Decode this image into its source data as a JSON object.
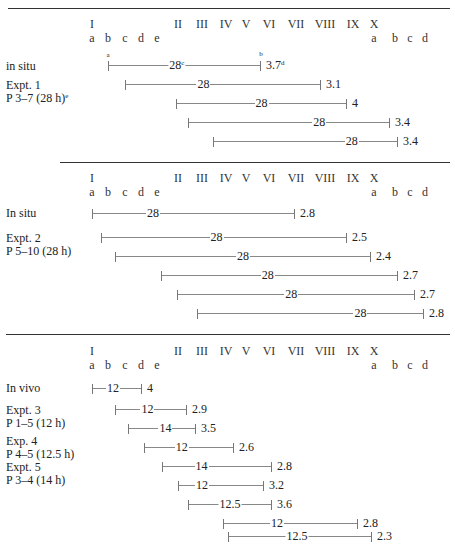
{
  "header_columns": {
    "roman": [
      {
        "label": "I",
        "x": 92
      },
      {
        "label": "II",
        "x": 178
      },
      {
        "label": "III",
        "x": 202
      },
      {
        "label": "IV",
        "x": 226
      },
      {
        "label": "V",
        "x": 246
      },
      {
        "label": "VI",
        "x": 269
      },
      {
        "label": "VII",
        "x": 296
      },
      {
        "label": "VIII",
        "x": 325
      },
      {
        "label": "IX",
        "x": 353
      },
      {
        "label": "X",
        "x": 374
      }
    ],
    "letters": [
      {
        "label": "a",
        "x": 92
      },
      {
        "label": "b",
        "x": 108
      },
      {
        "label": "c",
        "x": 125
      },
      {
        "label": "d",
        "x": 141
      },
      {
        "label": "e",
        "x": 157
      },
      {
        "label": "a",
        "x": 374
      },
      {
        "label": "b",
        "x": 395
      },
      {
        "label": "c",
        "x": 410
      },
      {
        "label": "d",
        "x": 425
      }
    ]
  },
  "sections": [
    {
      "labels": [
        "in situ",
        "Expt. 1",
        "P 3–7 (28 h)"
      ],
      "label_sup": "e",
      "bars": [
        {
          "start": 108,
          "end": 261,
          "value": "28",
          "value_x": 0.45,
          "end_label": "3.7",
          "end_sup": "d"
        },
        {
          "start": 125,
          "end": 321,
          "value": "28",
          "value_x": 0.4,
          "end_label": "3.1"
        },
        {
          "start": 176,
          "end": 347,
          "value": "28",
          "value_x": 0.5,
          "end_label": "4"
        },
        {
          "start": 188,
          "end": 390,
          "value": "28",
          "value_x": 0.65,
          "end_label": "3.4"
        },
        {
          "start": 213,
          "end": 398,
          "value": "28",
          "value_x": 0.75,
          "end_label": "3.4"
        }
      ],
      "annotations": {
        "start_sup": "a",
        "mid_sup": "c",
        "end_sup_top": "b"
      }
    },
    {
      "labels": [
        "In situ",
        "Expt. 2",
        "P 5–10 (28 h)"
      ],
      "bars": [
        {
          "start": 92,
          "end": 295,
          "value": "28",
          "value_x": 0.3,
          "end_label": "2.8"
        },
        {
          "start": 101,
          "end": 347,
          "value": "28",
          "value_x": 0.47,
          "end_label": "2.5"
        },
        {
          "start": 115,
          "end": 371,
          "value": "28",
          "value_x": 0.5,
          "end_label": "2.4"
        },
        {
          "start": 161,
          "end": 398,
          "value": "28",
          "value_x": 0.45,
          "end_label": "2.7"
        },
        {
          "start": 177,
          "end": 415,
          "value": "28",
          "value_x": 0.48,
          "end_label": "2.7"
        },
        {
          "start": 197,
          "end": 424,
          "value": "28",
          "value_x": 0.72,
          "end_label": "2.8"
        }
      ]
    },
    {
      "labels": [
        "In vivo",
        "Expt. 3",
        "P 1–5 (12 h)",
        "Exp. 4",
        "P 4–5 (12.5 h)",
        "Expt. 5",
        "P 3–4 (14 h)"
      ],
      "bars": [
        {
          "start": 92,
          "end": 142,
          "value": "12",
          "value_x": 0.42,
          "end_label": "4"
        },
        {
          "start": 115,
          "end": 187,
          "value": "12",
          "value_x": 0.45,
          "end_label": "2.9"
        },
        {
          "start": 128,
          "end": 196,
          "value": "14",
          "value_x": 0.55,
          "end_label": "3.5"
        },
        {
          "start": 144,
          "end": 234,
          "value": "12",
          "value_x": 0.42,
          "end_label": "2.6"
        },
        {
          "start": 162,
          "end": 272,
          "value": "14",
          "value_x": 0.36,
          "end_label": "2.8"
        },
        {
          "start": 178,
          "end": 264,
          "value": "12",
          "value_x": 0.28,
          "end_label": "3.2"
        },
        {
          "start": 188,
          "end": 272,
          "value": "12.5",
          "value_x": 0.5,
          "end_label": "3.6"
        },
        {
          "start": 223,
          "end": 358,
          "value": "12",
          "value_x": 0.4,
          "end_label": "2.8"
        },
        {
          "start": 228,
          "end": 372,
          "value": "12.5",
          "value_x": 0.48,
          "end_label": "2.3"
        }
      ]
    }
  ]
}
